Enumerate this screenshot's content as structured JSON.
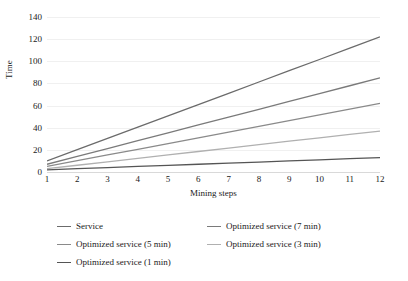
{
  "chart_data": {
    "type": "line",
    "title": "",
    "xlabel": "Mining steps",
    "ylabel": "Time",
    "x": [
      1,
      2,
      3,
      4,
      5,
      6,
      7,
      8,
      9,
      10,
      11,
      12
    ],
    "xlim": [
      1,
      12
    ],
    "ylim": [
      0,
      140
    ],
    "yticks": [
      0,
      20,
      40,
      60,
      80,
      100,
      120,
      140
    ],
    "grid": true,
    "legend_position": "bottom",
    "series": [
      {
        "name": "Service",
        "color": "#6b6b6b",
        "values": [
          10,
          20.2,
          30.4,
          40.6,
          50.7,
          60.9,
          71.1,
          81.3,
          91.5,
          101.6,
          111.8,
          122
        ]
      },
      {
        "name": "Optimized service (7 min)",
        "color": "#7a7a7a",
        "values": [
          7,
          14.1,
          21.2,
          28.3,
          35.4,
          42.5,
          49.5,
          56.6,
          63.7,
          70.8,
          77.9,
          85
        ]
      },
      {
        "name": "Optimized service (5 min)",
        "color": "#8a8a8a",
        "values": [
          5,
          10.2,
          15.4,
          20.5,
          25.7,
          30.9,
          36.1,
          41.3,
          46.4,
          51.6,
          56.8,
          62
        ]
      },
      {
        "name": "Optimized service (3 min)",
        "color": "#b0b0b0",
        "values": [
          3,
          6.1,
          9.2,
          12.3,
          15.4,
          18.5,
          21.6,
          24.7,
          27.8,
          30.9,
          34,
          37
        ]
      },
      {
        "name": "Optimized service (1 min)",
        "color": "#555555",
        "values": [
          2,
          3,
          4,
          5,
          6,
          7,
          8,
          9,
          10,
          11,
          12,
          13
        ]
      }
    ]
  },
  "legend": {
    "rows": [
      [
        "Service",
        "Optimized service (7 min)"
      ],
      [
        "Optimized service (5 min)",
        "Optimized service (3 min)"
      ],
      [
        "Optimized service (1 min)"
      ]
    ]
  }
}
